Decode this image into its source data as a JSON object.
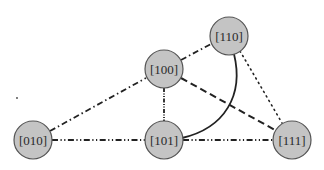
{
  "diagram": {
    "type": "graph",
    "node_fill": "#c4c4c4",
    "node_stroke": "#555555",
    "edge_color": "#222222",
    "nodes": [
      {
        "id": "n110",
        "label": "[110]",
        "cx": 229,
        "cy": 36
      },
      {
        "id": "n100",
        "label": "[100]",
        "cx": 164,
        "cy": 69
      },
      {
        "id": "n010",
        "label": "[010]",
        "cx": 33,
        "cy": 140
      },
      {
        "id": "n101",
        "label": "[101]",
        "cx": 164,
        "cy": 140
      },
      {
        "id": "n111",
        "label": "[111]",
        "cx": 292,
        "cy": 140
      }
    ],
    "edges": [
      {
        "from": "[010]",
        "to": "[100]",
        "style": "dash-dot"
      },
      {
        "from": "[100]",
        "to": "[110]",
        "style": "dash-dot"
      },
      {
        "from": "[100]",
        "to": "[101]",
        "style": "dash-dot-dot"
      },
      {
        "from": "[100]",
        "to": "[111]",
        "style": "dashed"
      },
      {
        "from": "[110]",
        "to": "[101]",
        "style": "solid-curve"
      },
      {
        "from": "[110]",
        "to": "[111]",
        "style": "dotted"
      },
      {
        "from": "[010]",
        "to": "[101]",
        "style": "dash-dot-dot"
      },
      {
        "from": "[101]",
        "to": "[111]",
        "style": "dash-dot-dot"
      }
    ]
  }
}
